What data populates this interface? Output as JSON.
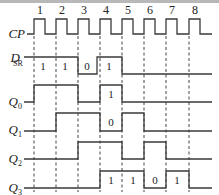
{
  "diagram": {
    "type": "timing-diagram",
    "clock_pulses": [
      "1",
      "2",
      "3",
      "4",
      "5",
      "6",
      "7",
      "8"
    ],
    "clock_edges_x": [
      34,
      56,
      78,
      100,
      122,
      144,
      166,
      189
    ],
    "signals": [
      {
        "name": "CP",
        "sub": "",
        "label_y": 38,
        "high_y": 19,
        "low_y": 34
      },
      {
        "name": "D",
        "sub": "SR",
        "label_y": 62,
        "high_y": 57,
        "low_y": 74,
        "values": [
          {
            "x": 43,
            "text": "1"
          },
          {
            "x": 65,
            "text": "1"
          },
          {
            "x": 87,
            "text": "0"
          },
          {
            "x": 109,
            "text": "1"
          }
        ]
      },
      {
        "name": "Q",
        "sub": "0",
        "label_y": 106,
        "high_y": 85,
        "low_y": 102,
        "values": [
          {
            "x": 111,
            "text": "1"
          }
        ]
      },
      {
        "name": "Q",
        "sub": "1",
        "label_y": 134,
        "high_y": 113,
        "low_y": 131,
        "values": [
          {
            "x": 111,
            "text": "0"
          }
        ]
      },
      {
        "name": "Q",
        "sub": "2",
        "label_y": 163,
        "high_y": 142,
        "low_y": 159
      },
      {
        "name": "Q",
        "sub": "3",
        "label_y": 192,
        "high_y": 171,
        "low_y": 188,
        "values": [
          {
            "x": 111,
            "text": "1"
          },
          {
            "x": 133,
            "text": "1"
          },
          {
            "x": 155,
            "text": "0"
          },
          {
            "x": 177,
            "text": "1"
          }
        ]
      }
    ]
  },
  "labels": {
    "cp": "CP",
    "dsr_main": "D",
    "dsr_sub": "SR",
    "q": "Q",
    "q0_sub": "0",
    "q1_sub": "1",
    "q2_sub": "2",
    "q3_sub": "3"
  },
  "pulse_numbers": {
    "p1": "1",
    "p2": "2",
    "p3": "3",
    "p4": "4",
    "p5": "5",
    "p6": "6",
    "p7": "7",
    "p8": "8"
  },
  "values": {
    "dsr_1": "1",
    "dsr_2": "1",
    "dsr_3": "0",
    "dsr_4": "1",
    "q0_4": "1",
    "q1_4": "0",
    "q3_4": "1",
    "q3_5": "1",
    "q3_6": "0",
    "q3_7": "1"
  }
}
